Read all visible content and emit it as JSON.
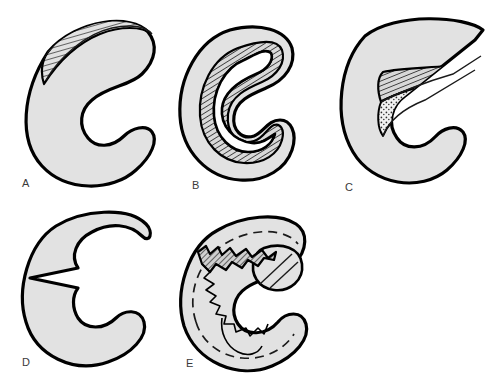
{
  "figure": {
    "background_color": "#ffffff",
    "body_fill_color": "#e2e2e2",
    "outline_color": "#000000",
    "label_color": "#3a3a3a",
    "panel_count": 5,
    "rows": 2,
    "columns": 3
  },
  "panels": [
    {
      "id": "A",
      "label": "A",
      "tear_type": "longitudinal-tear",
      "description": "C-shaped meniscus with a thin hatched crescent along the superior-lateral outer border",
      "label_x": 22,
      "label_y": 178,
      "markings": [
        "hatched-crescent"
      ]
    },
    {
      "id": "B",
      "label": "B",
      "tear_type": "bucket-handle-tear",
      "description": "Meniscus with a continuous hatched inner ring representing a displaced bucket-handle fragment",
      "label_x": 192,
      "label_y": 180,
      "markings": [
        "hatched-ring"
      ]
    },
    {
      "id": "C",
      "label": "C",
      "tear_type": "flap-tear",
      "description": "Meniscus with a hatched upper flap over a stippled wedge, the anterior horn drawn to a sharp point",
      "label_x": 345,
      "label_y": 182,
      "markings": [
        "hatched-flap",
        "stippled-wedge",
        "pointed-horn"
      ]
    },
    {
      "id": "D",
      "label": "D",
      "tear_type": "radial-tear",
      "description": "Meniscus with a narrow V-shaped radial notch cut inward from the inner free edge",
      "label_x": 22,
      "label_y": 357,
      "markings": [
        "v-notch"
      ]
    },
    {
      "id": "E",
      "label": "E",
      "tear_type": "complex-degenerative-tear",
      "description": "Meniscus with jagged irregular torn margins and a dashed arc showing the original intact contour",
      "label_x": 186,
      "label_y": 358,
      "markings": [
        "jagged-edge",
        "dashed-original-outline",
        "rounded-lobe"
      ]
    }
  ]
}
